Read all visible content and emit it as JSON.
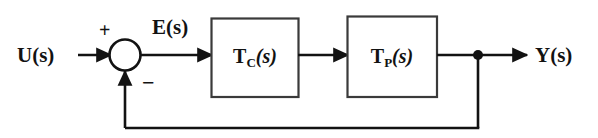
{
  "diagram": {
    "type": "block-diagram",
    "background_color": "#ffffff",
    "line_color": "#121212",
    "text_color": "#121212",
    "signals": {
      "input": {
        "symbol": "U",
        "argument": "(s)",
        "full": "U(s)"
      },
      "error": {
        "symbol": "E",
        "argument": "(s)",
        "full": "E(s)"
      },
      "output": {
        "symbol": "Y",
        "argument": "(s)",
        "full": "Y(s)"
      }
    },
    "blocks": [
      {
        "id": "controller",
        "symbol": "T",
        "subscript": "C",
        "argument": "(s)",
        "full": "T_C(s)"
      },
      {
        "id": "plant",
        "symbol": "T",
        "subscript": "P",
        "argument": "(s)",
        "full": "T_P(s)"
      }
    ],
    "summing_junction": {
      "name": "summing-junction",
      "plus_sign": "+",
      "minus_sign": "−"
    },
    "feedback": {
      "name": "unity-feedback-path",
      "takeoff_node": "●"
    }
  }
}
